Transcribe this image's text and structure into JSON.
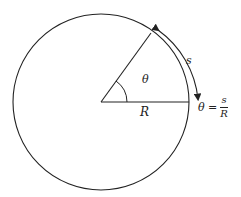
{
  "diagram": {
    "labels": {
      "theta": "θ",
      "radius": "R",
      "arc": "s"
    },
    "equation": {
      "lhs": "θ =",
      "numerator": "s",
      "denominator": "R"
    },
    "colors": {
      "stroke": "#222222",
      "background": "#ffffff"
    }
  }
}
